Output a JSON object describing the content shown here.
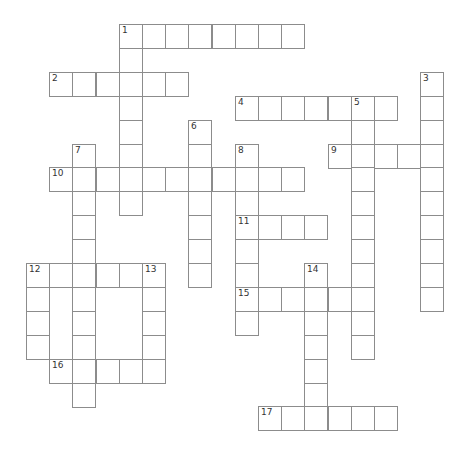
{
  "puzzle": {
    "type": "crossword",
    "grid": {
      "origin_x": 26,
      "origin_y": 24,
      "cell_w": 23.2,
      "cell_h": 23.9,
      "border_color": "#8c8c8c",
      "cell_color": "#ffffff"
    },
    "entries": [
      {
        "number": "1",
        "direction": "across",
        "row": 0,
        "col": 4,
        "length": 8
      },
      {
        "number": "1",
        "direction": "down",
        "row": 0,
        "col": 4,
        "length": 8
      },
      {
        "number": "2",
        "direction": "across",
        "row": 2,
        "col": 1,
        "length": 6
      },
      {
        "number": "3",
        "direction": "down",
        "row": 2,
        "col": 17,
        "length": 10
      },
      {
        "number": "4",
        "direction": "across",
        "row": 3,
        "col": 9,
        "length": 7
      },
      {
        "number": "5",
        "direction": "down",
        "row": 3,
        "col": 14,
        "length": 11
      },
      {
        "number": "6",
        "direction": "down",
        "row": 4,
        "col": 7,
        "length": 7
      },
      {
        "number": "7",
        "direction": "down",
        "row": 5,
        "col": 2,
        "length": 11
      },
      {
        "number": "8",
        "direction": "down",
        "row": 5,
        "col": 9,
        "length": 8
      },
      {
        "number": "9",
        "direction": "across",
        "row": 5,
        "col": 13,
        "length": 5
      },
      {
        "number": "10",
        "direction": "across",
        "row": 6,
        "col": 1,
        "length": 11
      },
      {
        "number": "11",
        "direction": "across",
        "row": 8,
        "col": 9,
        "length": 4
      },
      {
        "number": "12",
        "direction": "across",
        "row": 10,
        "col": 0,
        "length": 6
      },
      {
        "number": "12",
        "direction": "down",
        "row": 10,
        "col": 0,
        "length": 4
      },
      {
        "number": "13",
        "direction": "down",
        "row": 10,
        "col": 5,
        "length": 5
      },
      {
        "number": "14",
        "direction": "down",
        "row": 10,
        "col": 12,
        "length": 7
      },
      {
        "number": "15",
        "direction": "across",
        "row": 11,
        "col": 9,
        "length": 6
      },
      {
        "number": "16",
        "direction": "across",
        "row": 14,
        "col": 1,
        "length": 5
      },
      {
        "number": "17",
        "direction": "across",
        "row": 16,
        "col": 10,
        "length": 6
      }
    ]
  }
}
